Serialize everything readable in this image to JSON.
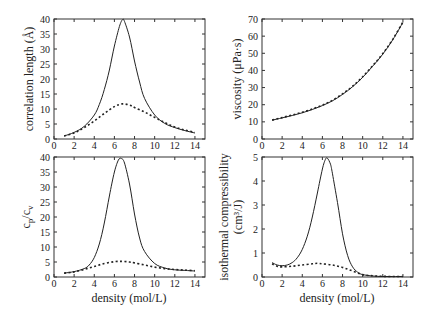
{
  "chart_data": [
    {
      "id": "correlation-length",
      "type": "line",
      "xlabel": "",
      "ylabel": "correlation length (Å)",
      "xlim": [
        0,
        15
      ],
      "ylim": [
        0,
        40
      ],
      "xticks": [
        0,
        2,
        4,
        6,
        8,
        10,
        12,
        14
      ],
      "yticks": [
        0,
        5,
        10,
        15,
        20,
        25,
        30,
        35,
        40
      ],
      "grid": false,
      "series": [
        {
          "name": "solid",
          "style": "solid",
          "x": [
            1,
            2,
            3,
            4,
            4.5,
            5,
            5.5,
            6,
            6.5,
            6.8,
            7,
            7.5,
            8,
            8.5,
            9,
            10,
            11,
            12,
            13,
            14
          ],
          "y": [
            1,
            2.2,
            4.2,
            8,
            11.5,
            16.5,
            23,
            31,
            37.5,
            39.8,
            39.2,
            34,
            26,
            19,
            13.5,
            8,
            5.2,
            3.8,
            2.8,
            2
          ]
        },
        {
          "name": "dotted",
          "style": "dotted",
          "x": [
            1,
            2,
            3,
            4,
            5,
            6,
            6.8,
            7.5,
            8,
            9,
            10,
            11,
            12,
            13,
            14
          ],
          "y": [
            1,
            2,
            3.8,
            6,
            8.5,
            10.8,
            11.7,
            11.3,
            10.5,
            9,
            7.2,
            5.5,
            4,
            3,
            2.2
          ]
        }
      ]
    },
    {
      "id": "viscosity",
      "type": "line",
      "xlabel": "",
      "ylabel": "viscosity (μPa·s)",
      "xlim": [
        0,
        15
      ],
      "ylim": [
        0,
        70
      ],
      "xticks": [
        0,
        2,
        4,
        6,
        8,
        10,
        12,
        14
      ],
      "yticks": [
        0,
        10,
        20,
        30,
        40,
        50,
        60,
        70
      ],
      "grid": false,
      "series": [
        {
          "name": "solid",
          "style": "solid",
          "x": [
            1,
            2,
            3,
            4,
            5,
            6,
            7,
            8,
            9,
            10,
            11,
            12,
            13,
            14
          ],
          "y": [
            11,
            12.3,
            13.7,
            15.3,
            17.2,
            19.5,
            22.3,
            26,
            30.5,
            36,
            42.5,
            49.5,
            58,
            68
          ]
        },
        {
          "name": "dotted",
          "style": "dotted",
          "x": [
            1,
            2,
            3,
            4,
            5,
            6,
            7,
            8,
            9,
            10,
            11,
            12,
            13,
            14
          ],
          "y": [
            11,
            12.5,
            14,
            15.6,
            17.5,
            19.8,
            22.6,
            26.3,
            30.8,
            36.3,
            42.8,
            49.8,
            58.3,
            68.2
          ]
        }
      ]
    },
    {
      "id": "cp-cv",
      "type": "line",
      "xlabel": "density (mol/L)",
      "ylabel": "cp/cv",
      "ylabel_main": "c",
      "ylabel_sub1": "p",
      "ylabel_sep": "/c",
      "ylabel_sub2": "v",
      "xlim": [
        0,
        15
      ],
      "ylim": [
        0,
        40
      ],
      "xticks": [
        0,
        2,
        4,
        6,
        8,
        10,
        12,
        14
      ],
      "yticks": [
        0,
        5,
        10,
        15,
        20,
        25,
        30,
        35,
        40
      ],
      "grid": false,
      "series": [
        {
          "name": "solid",
          "style": "solid",
          "x": [
            1,
            2,
            3,
            3.5,
            4,
            4.5,
            5,
            5.5,
            6,
            6.4,
            6.7,
            7,
            7.5,
            8,
            8.5,
            9,
            10,
            11,
            12,
            13,
            14
          ],
          "y": [
            1.3,
            1.8,
            2.8,
            4,
            6.5,
            11,
            18,
            27,
            35,
            39,
            39.5,
            38,
            31,
            21,
            13,
            8.5,
            4.5,
            3,
            2.4,
            2.2,
            2
          ]
        },
        {
          "name": "dotted",
          "style": "dotted",
          "x": [
            1,
            2,
            3,
            4,
            5,
            6,
            6.8,
            7.5,
            8,
            9,
            10,
            11,
            12,
            13,
            14
          ],
          "y": [
            1.3,
            1.7,
            2.5,
            3.5,
            4.5,
            5.1,
            5.2,
            5,
            4.7,
            4,
            3.3,
            2.8,
            2.5,
            2.3,
            2.1
          ]
        }
      ]
    },
    {
      "id": "isothermal-compressibility",
      "type": "line",
      "xlabel": "density (mol/L)",
      "ylabel": "isothermal compressibility (cm³/J)",
      "ylabel_line1": "isothermal compressibility",
      "ylabel_line2": "(cm³/J)",
      "xlim": [
        0,
        15
      ],
      "ylim": [
        0,
        5
      ],
      "xticks": [
        0,
        2,
        4,
        6,
        8,
        10,
        12,
        14
      ],
      "yticks": [
        0,
        1,
        2,
        3,
        4,
        5
      ],
      "grid": false,
      "series": [
        {
          "name": "solid",
          "style": "solid",
          "x": [
            1,
            1.5,
            2,
            2.5,
            3,
            3.5,
            4,
            4.5,
            5,
            5.5,
            6,
            6.3,
            6.5,
            6.8,
            7,
            7.5,
            8,
            8.5,
            9,
            9.5,
            10,
            11,
            12,
            13,
            14
          ],
          "y": [
            0.6,
            0.5,
            0.47,
            0.5,
            0.6,
            0.8,
            1.15,
            1.7,
            2.5,
            3.5,
            4.5,
            4.9,
            4.95,
            4.7,
            4.3,
            3.1,
            1.8,
            0.9,
            0.42,
            0.2,
            0.1,
            0.04,
            0.02,
            0.02,
            0.02
          ]
        },
        {
          "name": "dotted",
          "style": "dotted",
          "x": [
            1,
            1.5,
            2,
            3,
            4,
            5,
            5.5,
            6,
            7,
            8,
            9,
            10,
            11,
            12,
            13,
            14
          ],
          "y": [
            0.55,
            0.45,
            0.42,
            0.45,
            0.5,
            0.55,
            0.57,
            0.55,
            0.5,
            0.4,
            0.25,
            0.1,
            0.05,
            0.03,
            0.02,
            0.02
          ]
        }
      ]
    }
  ],
  "panels_layout": [
    {
      "left": 54,
      "top": 19,
      "width": 151,
      "height": 120
    },
    {
      "left": 262,
      "top": 19,
      "width": 151,
      "height": 120
    },
    {
      "left": 54,
      "top": 157,
      "width": 151,
      "height": 120
    },
    {
      "left": 262,
      "top": 157,
      "width": 151,
      "height": 120
    }
  ]
}
